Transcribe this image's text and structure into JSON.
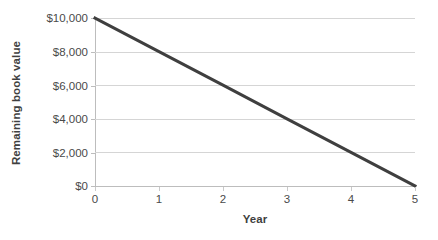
{
  "chart_data": {
    "type": "line",
    "title": "",
    "subtitle": "",
    "xlabel": "Year",
    "ylabel": "Remaining book value",
    "x": [
      0,
      1,
      2,
      3,
      4,
      5
    ],
    "series": [
      {
        "name": "Remaining book value",
        "values": [
          10000,
          8000,
          6000,
          4000,
          2000,
          0
        ]
      }
    ],
    "xlim": [
      0,
      5
    ],
    "ylim": [
      0,
      10000
    ],
    "xticks": [
      0,
      1,
      2,
      3,
      4,
      5
    ],
    "xtick_labels": [
      "0",
      "1",
      "2",
      "3",
      "4",
      "5"
    ],
    "yticks": [
      0,
      2000,
      4000,
      6000,
      8000,
      10000
    ],
    "ytick_labels": [
      "$0",
      "$2,000",
      "$4,000",
      "$6,000",
      "$8,000",
      "$10,000"
    ],
    "grid": "horizontal",
    "legend": "none",
    "annotations": [],
    "colors": {
      "line": "#3f3f3f",
      "gridline": "#d5d5d5",
      "axis": "#bdbdbd",
      "tick_text": "#4a4a4a",
      "axis_title_text": "#3f3f3f",
      "background": "#ffffff"
    },
    "line_width_px": 3
  }
}
